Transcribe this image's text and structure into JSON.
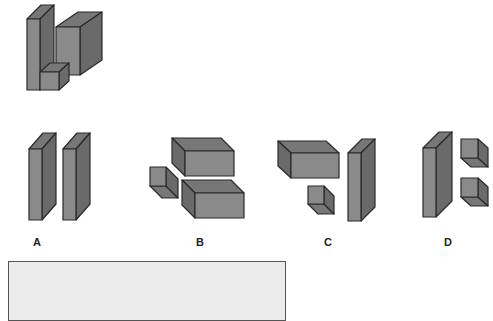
{
  "colors": {
    "front": "#8a8a8a",
    "top": "#777777",
    "side": "#6a6a6a",
    "stroke": "#2a2a2a",
    "answer_box_bg": "#ececec"
  },
  "question_figure": {
    "boxes": [
      {
        "x": 56,
        "y": 27,
        "w": 24,
        "h": 48,
        "dx": 22,
        "dy": -15
      },
      {
        "x": 27,
        "y": 19,
        "w": 13,
        "h": 71,
        "dx": 14,
        "dy": -14
      },
      {
        "x": 40,
        "y": 72,
        "w": 19,
        "h": 18,
        "dx": 10,
        "dy": -9
      }
    ]
  },
  "options": [
    {
      "label": "A",
      "label_x": 37,
      "label_y": 236,
      "boxes": [
        {
          "x": 29,
          "y": 149,
          "w": 13,
          "h": 71,
          "dx": 14,
          "dy": -16
        },
        {
          "x": 63,
          "y": 149,
          "w": 13,
          "h": 71,
          "dx": 14,
          "dy": -16
        }
      ]
    },
    {
      "label": "B",
      "label_x": 200,
      "label_y": 236,
      "boxes": [
        {
          "x": 185,
          "y": 151,
          "w": 49,
          "h": 25,
          "dx": -13,
          "dy": -13
        },
        {
          "x": 195,
          "y": 193,
          "w": 49,
          "h": 25,
          "dx": -13,
          "dy": -13
        },
        {
          "x": 150,
          "y": 167,
          "w": 16,
          "h": 19,
          "dx": 12,
          "dy": 12
        }
      ]
    },
    {
      "label": "C",
      "label_x": 328,
      "label_y": 236,
      "boxes": [
        {
          "x": 291,
          "y": 153,
          "w": 48,
          "h": 25,
          "dx": -13,
          "dy": -12
        },
        {
          "x": 308,
          "y": 186,
          "w": 16,
          "h": 18,
          "dx": 10,
          "dy": 10
        },
        {
          "x": 348,
          "y": 153,
          "w": 13,
          "h": 68,
          "dx": 14,
          "dy": -14
        }
      ]
    },
    {
      "label": "D",
      "label_x": 448,
      "label_y": 236,
      "boxes": [
        {
          "x": 423,
          "y": 148,
          "w": 13,
          "h": 69,
          "dx": 16,
          "dy": -16
        },
        {
          "x": 461,
          "y": 139,
          "w": 17,
          "h": 19,
          "dx": 10,
          "dy": 9
        },
        {
          "x": 461,
          "y": 178,
          "w": 17,
          "h": 19,
          "dx": 10,
          "dy": 9
        }
      ]
    }
  ],
  "answer_box": {
    "text": ""
  }
}
